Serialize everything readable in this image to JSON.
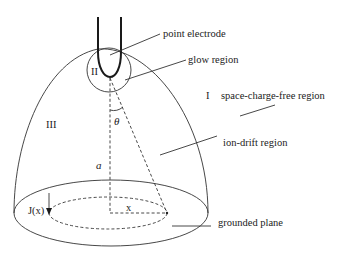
{
  "figure": {
    "labels": {
      "point_electrode": "point electrode",
      "glow_region": "glow region",
      "space_charge_free_region": "space-charge-free region",
      "ion_drift_region": "ion-drift region",
      "grounded_plane": "grounded plane"
    },
    "region_numerals": {
      "region_I": "I",
      "region_II": "II",
      "region_III": "III"
    },
    "symbols": {
      "theta": "θ",
      "a": "a",
      "x": "x",
      "current_density": "J(x)"
    },
    "colors": {
      "line": "#333333",
      "electrode": "#1a1a1a",
      "background": "#ffffff"
    }
  }
}
